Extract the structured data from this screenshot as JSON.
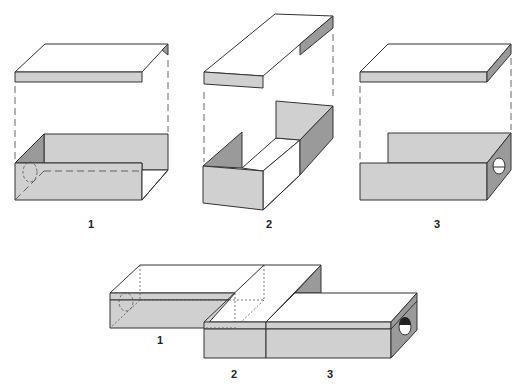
{
  "diagram": {
    "components": [
      {
        "id": "1",
        "label": "1",
        "parts": [
          "lid",
          "open box with dashed hole on left end"
        ]
      },
      {
        "id": "2",
        "label": "2",
        "parts": [
          "lid with side flap",
          "open U-shaped frame"
        ]
      },
      {
        "id": "3",
        "label": "3",
        "parts": [
          "lid",
          "box with circular hole on right end"
        ]
      }
    ],
    "assembled": {
      "labels": [
        "1",
        "2",
        "3"
      ]
    },
    "colors": {
      "light_face": "#d0d0d0",
      "dark_face": "#9a9a9a",
      "top_face": "#ffffff",
      "outline": "#333333"
    }
  }
}
